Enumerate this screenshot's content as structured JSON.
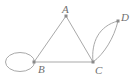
{
  "figure": {
    "name": "undirected-multigraph",
    "background_color": "#ffffff",
    "edge_color": "#a9a9a9",
    "vertex_color": "#8a8a8a",
    "label_color": "#6f6f6f",
    "width": 138,
    "height": 82
  },
  "vertices": [
    {
      "id": "A",
      "label": "A",
      "x": 66,
      "y": 16,
      "label_x": 62,
      "label_y": 13
    },
    {
      "id": "B",
      "label": "B",
      "x": 34,
      "y": 62,
      "label_x": 38,
      "label_y": 73
    },
    {
      "id": "C",
      "label": "C",
      "x": 93,
      "y": 62,
      "label_x": 95,
      "label_y": 74
    },
    {
      "id": "D",
      "label": "D",
      "x": 118,
      "y": 21,
      "label_x": 121,
      "label_y": 21
    }
  ],
  "edges": [
    {
      "id": "edge-a-b",
      "from": "A",
      "to": "B",
      "kind": "straight",
      "path": "M 66 16 L 34 62"
    },
    {
      "id": "edge-a-c",
      "from": "A",
      "to": "C",
      "kind": "straight",
      "path": "M 66 16 L 93 62"
    },
    {
      "id": "edge-b-c",
      "from": "B",
      "to": "C",
      "kind": "straight",
      "path": "M 34 62 L 93 62"
    },
    {
      "id": "edge-c-d-left",
      "from": "C",
      "to": "D",
      "kind": "curve",
      "path": "M 93 62 C 91 42 99 26 118 21"
    },
    {
      "id": "edge-c-d-right",
      "from": "C",
      "to": "D",
      "kind": "curve",
      "path": "M 93 62 C 104 54 114 38 118 21"
    },
    {
      "id": "loop-b",
      "from": "B",
      "to": "B",
      "kind": "self-loop",
      "cx": 20,
      "cy": 62,
      "rx": 14.5,
      "ry": 9.5
    }
  ],
  "counts": {
    "vertices": 4,
    "edges": 6
  }
}
